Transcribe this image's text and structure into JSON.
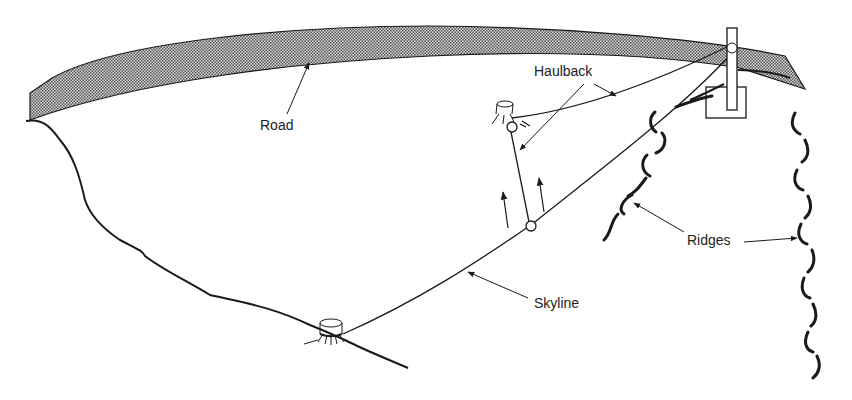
{
  "labels": {
    "road": "Road",
    "haulback": "Haulback",
    "skyline": "Skyline",
    "ridges": "Ridges"
  },
  "colors": {
    "ink": "#1a1a1a",
    "road_fill": "#9a9a9a",
    "background": "#ffffff"
  }
}
